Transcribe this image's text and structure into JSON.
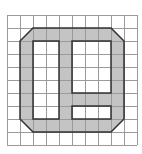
{
  "diagram": {
    "type": "grid-shape",
    "grid": {
      "cols": 10,
      "rows": 10,
      "origin_x": 7,
      "origin_y": 15,
      "cell": 13,
      "line_color": "#9a9a9a"
    },
    "shape": {
      "fill": "#c4c4c4",
      "stroke": "#333333",
      "outer_octagon_cells": {
        "x0": 1,
        "y0": 1,
        "x1": 9,
        "y1": 9,
        "corner_cut": 1
      },
      "holes_cells": [
        {
          "name": "left-hole",
          "x0": 2,
          "y0": 2,
          "x1": 4,
          "y1": 8
        },
        {
          "name": "top-right-hole",
          "x0": 5,
          "y0": 2,
          "x1": 8,
          "y1": 6
        },
        {
          "name": "bottom-right-hole",
          "x0": 5,
          "y0": 7,
          "x1": 8,
          "y1": 8
        }
      ]
    }
  }
}
